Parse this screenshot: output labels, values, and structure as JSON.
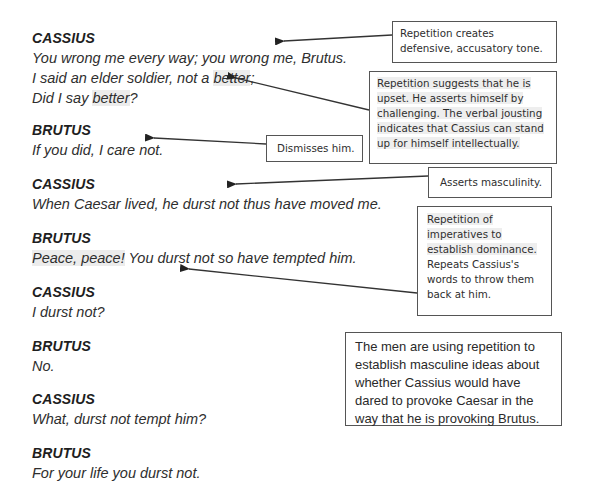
{
  "dialogue": [
    {
      "speaker": "CASSIUS",
      "lines": [
        "You wrong me every way; you wrong me, Brutus.",
        "I said an elder soldier, not a ",
        "better",
        ";",
        "Did I say ",
        "better",
        "?"
      ]
    },
    {
      "speaker": "BRUTUS",
      "lines": [
        "If you did, I care not."
      ]
    },
    {
      "speaker": "CASSIUS",
      "lines": [
        "When Caesar lived, he durst not thus have moved me."
      ]
    },
    {
      "speaker": "BRUTUS",
      "lines": [
        "Peace, peace!",
        " You durst not so have tempted him."
      ]
    },
    {
      "speaker": "CASSIUS",
      "lines": [
        "I durst not?"
      ]
    },
    {
      "speaker": "BRUTUS",
      "lines": [
        "No."
      ]
    },
    {
      "speaker": "CASSIUS",
      "lines": [
        "What, durst not tempt him?"
      ]
    },
    {
      "speaker": "BRUTUS",
      "lines": [
        "For your life you durst not."
      ]
    }
  ],
  "annotations": {
    "defensive": "Repetition creates defensive, accusatory tone.",
    "upset": "Repetition suggests that he is upset. He asserts himself by challenging. The verbal jousting indicates that Cassius can stand up for himself intellectually.",
    "dismisses": "Dismisses him.",
    "masculinity": "Asserts masculinity.",
    "imperatives_a": "Repetition of imperatives to establish dominance.",
    "imperatives_b": "Repeats Cassius's words to throw them back at him.",
    "summary": "The men are using repetition to establish masculine ideas about whether Cassius would have dared to provoke Caesar in the way that he is provoking Brutus."
  },
  "colors": {
    "text": "#2a2a2a",
    "highlight": "#ececec",
    "border": "#555555"
  }
}
